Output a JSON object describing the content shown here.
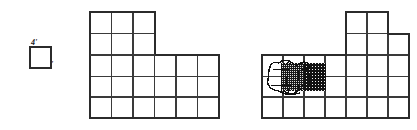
{
  "figure": {
    "title": "",
    "background_color": "#ffffff",
    "line_color": "#2b2b2b",
    "scribble_color": "#111111"
  },
  "unit_key": {
    "name": "unit-square-key",
    "label_top": "4'",
    "label_right": "4'",
    "cell_size_px": 21,
    "x": 30,
    "y": 47
  },
  "grid": {
    "cell_size_px": 21.5,
    "stroke_width": 1.3,
    "outline_stroke_width": 2.0
  },
  "shapes": [
    {
      "name": "middle-figure",
      "origin_x": 90,
      "origin_y": 12,
      "cols": 6,
      "rows": 5,
      "cells": [
        [
          0,
          0,
          0,
          0,
          0,
          0
        ],
        [
          0,
          0,
          0,
          0,
          0,
          0
        ],
        [
          1,
          1,
          1,
          1,
          1,
          1
        ],
        [
          1,
          1,
          1,
          1,
          1,
          1
        ],
        [
          1,
          1,
          1,
          1,
          1,
          1
        ]
      ],
      "top_block": {
        "col_start": 0,
        "col_end": 3,
        "rows": 2
      },
      "unit_count": 24
    },
    {
      "name": "right-figure",
      "origin_x": 262,
      "origin_y": 12,
      "cols": 7,
      "rows": 5,
      "cells": [
        [
          0,
          0,
          0,
          0,
          1,
          1,
          0
        ],
        [
          0,
          0,
          0,
          0,
          1,
          1,
          1
        ],
        [
          1,
          1,
          1,
          1,
          1,
          1,
          1
        ],
        [
          1,
          1,
          1,
          1,
          1,
          1,
          1
        ],
        [
          1,
          1,
          1,
          1,
          1,
          1,
          1
        ]
      ],
      "unit_count": 26
    }
  ],
  "scribble": {
    "name": "scribble-blob",
    "center_x": 296,
    "center_y": 77,
    "width": 58,
    "height": 44,
    "fill_style": "stipple",
    "covers_cells": 2
  }
}
